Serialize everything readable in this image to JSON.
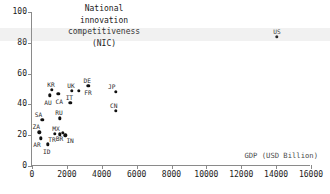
{
  "chart_data": {
    "type": "scatter",
    "title": "National\ninnovation\ncompetitiveness\n(NIC)",
    "xlabel": "GDP (USD Billion)",
    "ylabel": "National innovation competitiveness (NIC)",
    "xlim": [
      0,
      16000
    ],
    "ylim": [
      0,
      100
    ],
    "xticks": [
      0,
      2000,
      4000,
      6000,
      8000,
      10000,
      12000,
      14000,
      16000
    ],
    "yticks": [
      0,
      20,
      40,
      60,
      80,
      100
    ],
    "grid": false,
    "legend": false,
    "points": [
      {
        "label": "US",
        "x": 14050,
        "y": 84,
        "label_dx": 0,
        "label_dy": -8
      },
      {
        "label": "JP",
        "x": 4800,
        "y": 48,
        "label_dx": -4,
        "label_dy": -8
      },
      {
        "label": "CN",
        "x": 4800,
        "y": 36,
        "label_dx": -2,
        "label_dy": -8
      },
      {
        "label": "DE",
        "x": 3220,
        "y": 52,
        "label_dx": -1,
        "label_dy": -8
      },
      {
        "label": "FR",
        "x": 2700,
        "y": 49,
        "label_dx": 9,
        "label_dy": -1
      },
      {
        "label": "UK",
        "x": 2300,
        "y": 49,
        "label_dx": -1,
        "label_dy": -8
      },
      {
        "label": "IT",
        "x": 2200,
        "y": 41,
        "label_dx": -1,
        "label_dy": -8
      },
      {
        "label": "KR",
        "x": 1150,
        "y": 49.5,
        "label_dx": -1,
        "label_dy": -8
      },
      {
        "label": "CA",
        "x": 1500,
        "y": 47,
        "label_dx": 1,
        "label_dy": 5
      },
      {
        "label": "AU",
        "x": 1030,
        "y": 46,
        "label_dx": -2,
        "label_dy": 5
      },
      {
        "label": "RU",
        "x": 1600,
        "y": 31,
        "label_dx": -1,
        "label_dy": -8
      },
      {
        "label": "SA",
        "x": 600,
        "y": 30,
        "label_dx": -4,
        "label_dy": -8
      },
      {
        "label": "IN",
        "x": 1900,
        "y": 20,
        "label_dx": 5,
        "label_dy": 3
      },
      {
        "label": "BR",
        "x": 1750,
        "y": 21.5,
        "label_dx": -3,
        "label_dy": 3
      },
      {
        "label": "MX",
        "x": 1600,
        "y": 20.5,
        "label_dx": -4,
        "label_dy": -8
      },
      {
        "label": "TR",
        "x": 1320,
        "y": 21,
        "label_dx": -3,
        "label_dy": 3
      },
      {
        "label": "ZA",
        "x": 420,
        "y": 22,
        "label_dx": -3,
        "label_dy": -8
      },
      {
        "label": "AR",
        "x": 520,
        "y": 18,
        "label_dx": -4,
        "label_dy": 4
      },
      {
        "label": "ID",
        "x": 900,
        "y": 14,
        "label_dx": -1,
        "label_dy": 5
      }
    ]
  },
  "style": {
    "point_color": "#111111",
    "axis_color": "#8a8a8a",
    "text_color": "#1a1a1a",
    "background": "#ffffff"
  }
}
